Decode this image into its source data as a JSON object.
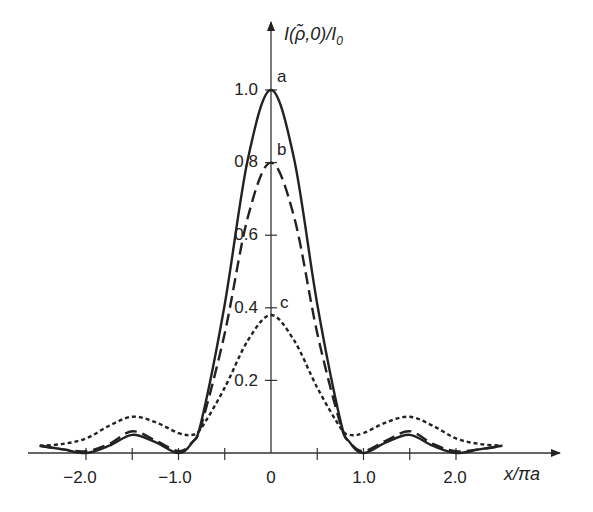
{
  "chart_data": {
    "type": "line",
    "title": "",
    "xlabel": "x/πa",
    "ylabel": "I(ρ̃,0)/I₀",
    "xlim": [
      -2.6,
      3.0
    ],
    "ylim": [
      0,
      1.1
    ],
    "grid": false,
    "legend": "none (curves labeled inline a, b, c)",
    "x_ticks": [
      -2.0,
      -1.5,
      -1.0,
      -0.5,
      0,
      0.5,
      1.0,
      1.5,
      2.0
    ],
    "x_tick_labels": [
      "−2.0",
      "−1.0",
      "0",
      "1.0",
      "2.0"
    ],
    "y_ticks": [
      0.2,
      0.4,
      0.6,
      0.8,
      1.0
    ],
    "y_tick_labels": [
      "0.2",
      "0.4",
      "0.6",
      "0.8",
      "1.0"
    ],
    "x": [
      -2.5,
      -2.25,
      -2.0,
      -1.75,
      -1.5,
      -1.25,
      -1.0,
      -0.85,
      -0.75,
      -0.5,
      -0.25,
      0,
      0.25,
      0.5,
      0.75,
      0.85,
      1.0,
      1.25,
      1.5,
      1.75,
      2.0,
      2.25,
      2.5
    ],
    "series": [
      {
        "name": "a",
        "style": "solid",
        "peak": 1.0,
        "values": [
          0.02,
          0.01,
          0.0,
          0.02,
          0.05,
          0.03,
          0.0,
          0.03,
          0.09,
          0.41,
          0.81,
          1.0,
          0.81,
          0.41,
          0.09,
          0.03,
          0.0,
          0.03,
          0.05,
          0.02,
          0.0,
          0.01,
          0.02
        ]
      },
      {
        "name": "b",
        "style": "dashed",
        "peak": 0.8,
        "values": [
          0.02,
          0.01,
          0.005,
          0.025,
          0.06,
          0.035,
          0.005,
          0.03,
          0.08,
          0.33,
          0.65,
          0.8,
          0.65,
          0.33,
          0.08,
          0.03,
          0.005,
          0.035,
          0.06,
          0.025,
          0.005,
          0.01,
          0.02
        ]
      },
      {
        "name": "c",
        "style": "dotted",
        "peak": 0.38,
        "values": [
          0.02,
          0.025,
          0.04,
          0.075,
          0.1,
          0.085,
          0.055,
          0.05,
          0.07,
          0.18,
          0.31,
          0.38,
          0.31,
          0.18,
          0.07,
          0.05,
          0.055,
          0.085,
          0.1,
          0.075,
          0.04,
          0.025,
          0.02
        ]
      }
    ],
    "annotations": [
      "a",
      "b",
      "c"
    ]
  },
  "labels": {
    "ylabel_main": "I(",
    "ylabel_rho": "ρ̃",
    "ylabel_rest": ",0)/I",
    "ylabel_sub": "0",
    "xlabel": "x/πa",
    "curve_a": "a",
    "curve_b": "b",
    "curve_c": "c",
    "y_ticks": [
      "0.2",
      "0.4",
      "0.6",
      "0.8",
      "1.0"
    ],
    "x_ticks": [
      "−2.0",
      "−1.0",
      "0",
      "1.0",
      "2.0"
    ]
  }
}
